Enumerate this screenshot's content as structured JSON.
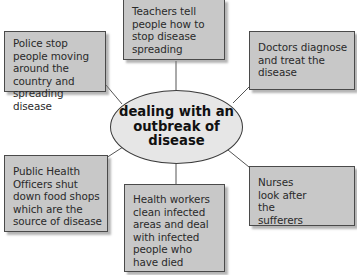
{
  "diagram": {
    "type": "spider-diagram",
    "center": {
      "label": "dealing with an outbreak of disease"
    },
    "nodes": [
      {
        "id": "teachers",
        "label": "Teachers tell people how to stop disease spreading"
      },
      {
        "id": "police",
        "label": "Police stop people moving around the country and spreading disease"
      },
      {
        "id": "doctors",
        "label": "Doctors diagnose and treat the disease"
      },
      {
        "id": "public-health",
        "label": "Public Health Officers shut down food shops which are the source of disease"
      },
      {
        "id": "health-workers",
        "label": "Health workers clean infected areas and deal with infected people who have died"
      },
      {
        "id": "nurses",
        "label": "Nurses look after the sufferers"
      }
    ],
    "colors": {
      "box_fill": "#c8c8c8",
      "box_border": "#4a4a4a",
      "center_fill": "#e6e6e6",
      "line": "#555555",
      "background": "#ffffff"
    }
  }
}
